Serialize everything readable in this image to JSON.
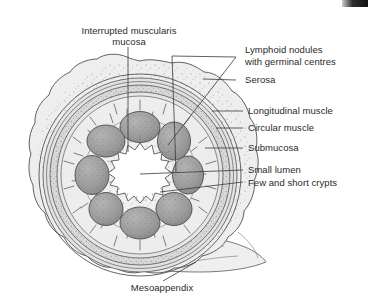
{
  "figure": {
    "caption": "Mesoappendix",
    "background_color": "#ffffff",
    "ink_color": "#4a4a4a",
    "text_color": "#2a2a2a"
  },
  "labels": {
    "top_left": {
      "line1": "Interrupted muscularis",
      "line2": "mucosa"
    },
    "right": [
      {
        "id": "lymphoid-nodules",
        "line1": "Lymphoid nodules",
        "line2": "with germinal centres"
      },
      {
        "id": "serosa",
        "line1": "Serosa",
        "line2": ""
      },
      {
        "id": "longitudinal-muscle",
        "line1": "Longitudinal muscle",
        "line2": ""
      },
      {
        "id": "circular-muscle",
        "line1": "Circular muscle",
        "line2": ""
      },
      {
        "id": "submucosa",
        "line1": "Submucosa",
        "line2": ""
      },
      {
        "id": "small-lumen",
        "line1": "Small lumen",
        "line2": ""
      },
      {
        "id": "few-and-short-crypts",
        "line1": "Few and short crypts",
        "line2": ""
      }
    ],
    "bottom": {
      "id": "mesoappendix",
      "text": "Mesoappendix"
    }
  },
  "anatomy": {
    "center_x": 140,
    "center_y": 175,
    "lumen_label": "Small lumen",
    "lumen_fill": "#ffffff",
    "nodule_count": 8,
    "nodule_fill": "#9a9a9a",
    "nodule_label": "Lymphoid nodule with germinal centre",
    "layers": [
      {
        "name": "serosa",
        "label": "Serosa",
        "fill": "#e8e8e8"
      },
      {
        "name": "longitudinal-muscle",
        "label": "Longitudinal muscle",
        "fill": "#dcdcdc"
      },
      {
        "name": "circular-muscle",
        "label": "Circular muscle",
        "fill": "#d2d2d2"
      },
      {
        "name": "submucosa",
        "label": "Submucosa",
        "fill": "#e4e4e4"
      },
      {
        "name": "mucosa",
        "label": "Interrupted muscularis mucosa",
        "fill": "#ededed"
      }
    ],
    "mesoappendix": {
      "name": "mesoappendix",
      "label": "Mesoappendix",
      "fill": "#ececec"
    }
  }
}
